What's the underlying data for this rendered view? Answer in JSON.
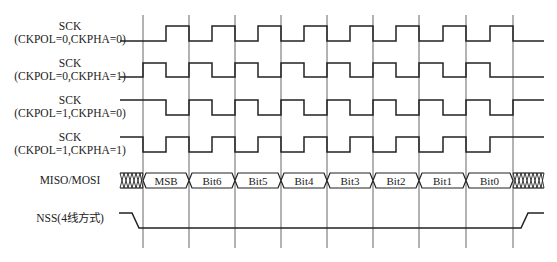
{
  "diagram": {
    "colors": {
      "signal": "#222222",
      "grid": "#555555",
      "background": "#ffffff"
    },
    "signals": [
      {
        "name": "SCK",
        "config": "(CKPOL=0,CKPHA=0)",
        "idle": "low",
        "phase": 0
      },
      {
        "name": "SCK",
        "config": "(CKPOL=0,CKPHA=1)",
        "idle": "low",
        "phase": 1
      },
      {
        "name": "SCK",
        "config": "(CKPOL=1,CKPHA=0)",
        "idle": "high",
        "phase": 0
      },
      {
        "name": "SCK",
        "config": "(CKPOL=1,CKPHA=1)",
        "idle": "high",
        "phase": 1
      }
    ],
    "data_bus": {
      "label": "MISO/MOSI",
      "bits": [
        "MSB",
        "Bit6",
        "Bit5",
        "Bit4",
        "Bit3",
        "Bit2",
        "Bit1",
        "Bit0"
      ]
    },
    "nss": {
      "label": "NSS(4线方式)"
    },
    "clock_cycles": 8
  }
}
